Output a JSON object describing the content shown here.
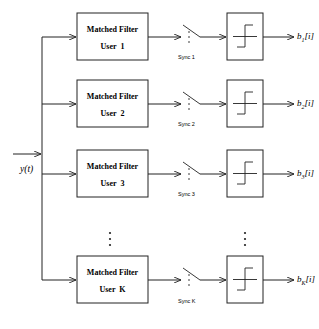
{
  "diagram": {
    "type": "matched-filter-bank-receiver",
    "input": {
      "label": "y(t)"
    },
    "branches": [
      {
        "filter_title": "Matched Filter",
        "filter_user": "User  1",
        "sync": "Sync 1",
        "output_base": "b",
        "output_sub": "1",
        "output_idx": "[i]"
      },
      {
        "filter_title": "Matched Filter",
        "filter_user": "User  2",
        "sync": "Sync 2",
        "output_base": "b",
        "output_sub": "2",
        "output_idx": "[i]"
      },
      {
        "filter_title": "Matched Filter",
        "filter_user": "User  3",
        "sync": "Sync 3",
        "output_base": "b",
        "output_sub": "3",
        "output_idx": "[i]"
      },
      {
        "filter_title": "Matched Filter",
        "filter_user": "User  K",
        "sync": "Sync K",
        "output_base": "b",
        "output_sub": "K",
        "output_idx": "[i]"
      }
    ],
    "ellipsis": "⋮"
  }
}
